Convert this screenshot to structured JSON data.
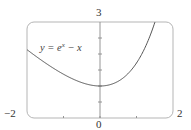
{
  "chart_data": {
    "type": "line",
    "title": "",
    "xlabel": "",
    "ylabel": "",
    "xlim": [
      -2,
      2
    ],
    "ylim": [
      0,
      3
    ],
    "grid": false,
    "legend": null,
    "annotations": [
      {
        "text": "y = e^x − x",
        "x": -1.6,
        "y": 2.3
      }
    ],
    "tick_labels": {
      "x": [
        "−2",
        "0",
        "2"
      ],
      "y": [
        "3"
      ]
    },
    "x_ticks": [
      -1,
      0,
      1
    ],
    "y_ticks": [
      0.5,
      1,
      1.5,
      2,
      2.5
    ],
    "series": [
      {
        "name": "y = e^x − x",
        "function": "exp(x) - x",
        "x": [
          -2,
          -1.5,
          -1,
          -0.5,
          0,
          0.5,
          1,
          1.25,
          1.5
        ],
        "y": [
          2.135,
          1.723,
          1.368,
          1.107,
          1.0,
          1.149,
          1.718,
          2.24,
          2.982
        ],
        "color": "#555555"
      }
    ]
  },
  "labels": {
    "x_min": "−2",
    "x_max": "2",
    "x_origin": "0",
    "y_max": "3",
    "equation_prefix": "y = e",
    "equation_exp": "x",
    "equation_suffix": " − x"
  },
  "colors": {
    "frame": "#b5b5b5",
    "axis": "#8a8a8a",
    "curve": "#555555",
    "text": "#333333"
  }
}
